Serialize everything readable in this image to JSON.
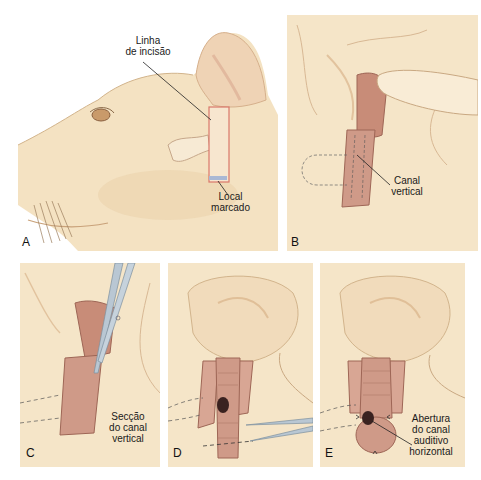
{
  "figure": {
    "colors": {
      "background": "#ffffff",
      "skin": "#f4e2c2",
      "skin_shadow": "#e6c9a0",
      "canal": "#c98a7a",
      "canal_dark": "#a86a5e",
      "incision_line": "#d9776a",
      "instrument": "#b9c7d3",
      "text": "#1a1a1a"
    },
    "panels": [
      {
        "letter": "A",
        "labels": [
          {
            "text_lines": [
              "Linha",
              "de incisão"
            ]
          },
          {
            "text_lines": [
              "Local",
              "marcado"
            ]
          }
        ]
      },
      {
        "letter": "B",
        "labels": [
          {
            "text_lines": [
              "Canal",
              "vertical"
            ]
          }
        ]
      },
      {
        "letter": "C",
        "labels": [
          {
            "text_lines": [
              "Secção",
              "do canal",
              "vertical"
            ]
          }
        ]
      },
      {
        "letter": "D",
        "labels": []
      },
      {
        "letter": "E",
        "labels": [
          {
            "text_lines": [
              "Abertura",
              "do canal",
              "auditivo",
              "horizontal"
            ]
          }
        ]
      }
    ]
  }
}
